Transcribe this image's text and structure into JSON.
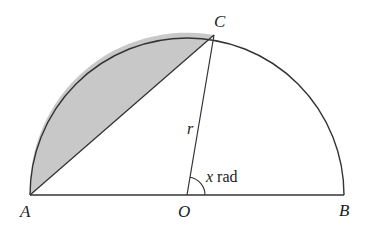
{
  "diagram": {
    "type": "semicircle-segment",
    "points": {
      "A": {
        "label": "A",
        "x": 30,
        "y": 195
      },
      "O": {
        "label": "O",
        "x": 187,
        "y": 195
      },
      "B": {
        "label": "B",
        "x": 344,
        "y": 195
      },
      "C": {
        "label": "C",
        "x": 214,
        "y": 35
      }
    },
    "radius_label": "r",
    "angle_label_var": "x",
    "angle_label_unit": " rad",
    "colors": {
      "stroke": "#333333",
      "shade": "#c8c8c8"
    },
    "shaded_region": "segment between chord AC and arc AC"
  }
}
